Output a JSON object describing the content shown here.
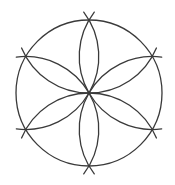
{
  "diagram": {
    "type": "compass-construction-hexafoil",
    "center": [
      89,
      93
    ],
    "radius": 73,
    "petal_count": 6,
    "stroke_color": "#3a3a3a",
    "stroke_width": 1.3,
    "background": "#ffffff",
    "extension_arcs": true
  }
}
